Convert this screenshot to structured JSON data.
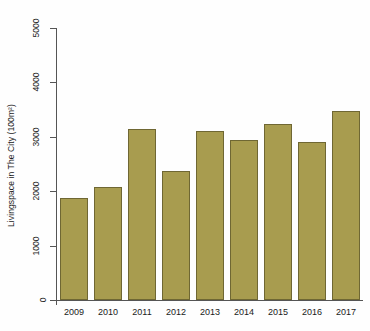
{
  "chart_data": {
    "type": "bar",
    "title": "",
    "xlabel": "",
    "ylabel": "Livingspace in The City (100m²)",
    "categories": [
      "2009",
      "2010",
      "2011",
      "2012",
      "2013",
      "2014",
      "2015",
      "2016",
      "2017"
    ],
    "values": [
      1880,
      2070,
      3140,
      2380,
      3100,
      2940,
      3230,
      2900,
      3470
    ],
    "ylim": [
      0,
      5000
    ],
    "yticks": [
      0,
      1000,
      2000,
      3000,
      4000,
      5000
    ],
    "ytick_labels": [
      "0",
      "1000",
      "2000",
      "3000",
      "4000",
      "5000"
    ],
    "grid": false,
    "legend": null,
    "bar_color": "#a89c4f",
    "bar_edge_color": "#6f6733",
    "background_color": "#ffffff",
    "axis_color": "#555555"
  }
}
